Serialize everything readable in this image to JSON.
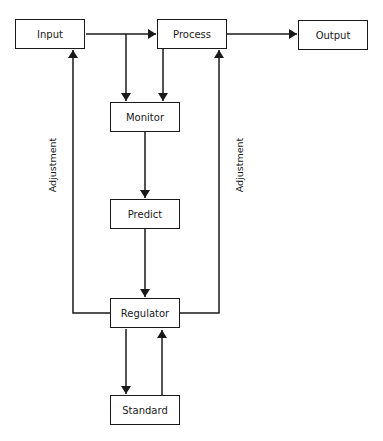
{
  "diagram": {
    "type": "flowchart",
    "nodes": [
      {
        "id": "input",
        "label": "Input"
      },
      {
        "id": "process",
        "label": "Process"
      },
      {
        "id": "output",
        "label": "Output"
      },
      {
        "id": "monitor",
        "label": "Monitor"
      },
      {
        "id": "predict",
        "label": "Predict"
      },
      {
        "id": "regulator",
        "label": "Regulator"
      },
      {
        "id": "standard",
        "label": "Standard"
      }
    ],
    "edges": [
      {
        "from": "input",
        "to": "process",
        "label": ""
      },
      {
        "from": "process",
        "to": "output",
        "label": ""
      },
      {
        "from": "input",
        "to": "monitor",
        "label": ""
      },
      {
        "from": "process",
        "to": "monitor",
        "label": ""
      },
      {
        "from": "monitor",
        "to": "predict",
        "label": ""
      },
      {
        "from": "predict",
        "to": "regulator",
        "label": ""
      },
      {
        "from": "regulator",
        "to": "input",
        "label": "Adjustment"
      },
      {
        "from": "regulator",
        "to": "process",
        "label": "Adjustment"
      },
      {
        "from": "regulator",
        "to": "standard",
        "label": ""
      },
      {
        "from": "standard",
        "to": "regulator",
        "label": ""
      }
    ],
    "edge_labels": {
      "left": "Adjustment",
      "right": "Adjustment"
    },
    "colors": {
      "stroke": "#1a1a1a",
      "background": "#ffffff"
    }
  }
}
